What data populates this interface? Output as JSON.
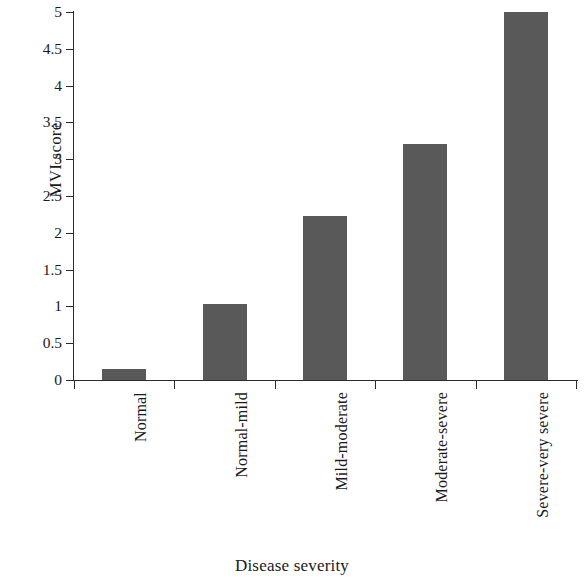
{
  "chart_data": {
    "type": "bar",
    "title": "",
    "xlabel": "Disease severity",
    "ylabel": "MVI score",
    "categories": [
      "Normal",
      "Normal-mild",
      "Mild-moderate",
      "Moderate-severe",
      "Severe-very severe"
    ],
    "values": [
      0.15,
      1.03,
      2.23,
      3.2,
      5.0
    ],
    "ylim": [
      0,
      5
    ],
    "ytick_labels": [
      "0",
      "0.5",
      "1",
      "1.5",
      "2",
      "2.5",
      "3",
      "3.5",
      "4",
      "4.5",
      "5"
    ],
    "ytick_values": [
      0,
      0.5,
      1,
      1.5,
      2,
      2.5,
      3,
      3.5,
      4,
      4.5,
      5
    ],
    "grid": false,
    "legend": null,
    "bar_color": "#595959",
    "axis_color": "#2b2b2b",
    "background": "#ffffff",
    "series": [
      {
        "name": "MVI score",
        "values": [
          0.15,
          1.03,
          2.23,
          3.2,
          5.0
        ]
      }
    ]
  }
}
